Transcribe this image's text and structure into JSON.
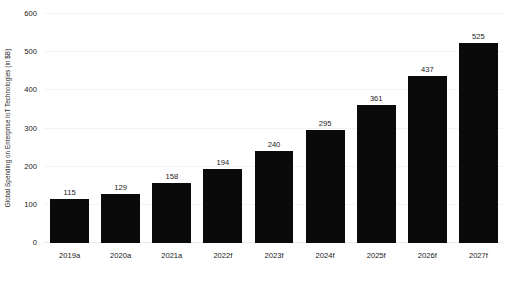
{
  "chart_data": {
    "type": "bar",
    "title": "",
    "subtitle": "",
    "xlabel": "",
    "ylabel": "Global Spending on Enterprise IoT Technologies (in $B)",
    "categories": [
      "2019a",
      "2020a",
      "2021a",
      "2022f",
      "2023f",
      "2024f",
      "2025f",
      "2026f",
      "2027f"
    ],
    "values": [
      115,
      129,
      158,
      194,
      240,
      295,
      361,
      437,
      525
    ],
    "value_labels": [
      "115",
      "129",
      "158",
      "194",
      "240",
      "295",
      "361",
      "437",
      "525"
    ],
    "ylim": [
      0,
      600
    ],
    "yticks": [
      0,
      100,
      200,
      300,
      400,
      500,
      600
    ],
    "ytick_labels": [
      "0",
      "100",
      "200",
      "300",
      "400",
      "500",
      "600"
    ],
    "grid": true,
    "legend": "none",
    "bar_color": "#0a0a0a",
    "background_color": "#ffffff",
    "gridline_color": "#f4f4f4",
    "text_color": "#1a1a1a"
  }
}
